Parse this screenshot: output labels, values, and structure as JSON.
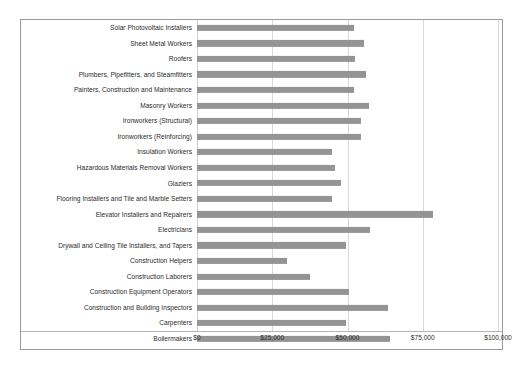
{
  "chart_data": {
    "type": "bar",
    "orientation": "horizontal",
    "title": "",
    "xlabel": "",
    "ylabel": "",
    "xlim": [
      0,
      100000
    ],
    "grid": true,
    "legend": null,
    "bar_color": "#949494",
    "tick_labels": [
      "$0",
      "$25,000",
      "$50,000",
      "$75,000",
      "$100,000"
    ],
    "ticks": [
      0,
      25000,
      50000,
      75000,
      100000
    ],
    "categories": [
      "Solar Photovoltaic Installers",
      "Sheet Metal Workers",
      "Roofers",
      "Plumbers, Pipefitters, and Steamfitters",
      "Painters, Construction and Maintenance",
      "Masonry Workers",
      "Ironworkers (Structural)",
      "Ironworkers (Reinforcing)",
      "Insulation Workers",
      "Hazardous Materials Removal Workers",
      "Glaziers",
      "Flooring Installers and Tile and Marble Setters",
      "Elevator Installers and Repairers",
      "Electricians",
      "Drywall and Ceiling Tile Installers, and Tapers",
      "Construction Helpers",
      "Construction Laborers",
      "Construction Equipment Operators",
      "Construction and Building Inspectors",
      "Carpenters",
      "Boilermakers"
    ],
    "values": [
      52000,
      55500,
      52500,
      56000,
      52000,
      57000,
      54500,
      54500,
      45000,
      46000,
      48000,
      45000,
      78500,
      57500,
      49500,
      30000,
      37500,
      50500,
      63500,
      49500,
      64000
    ]
  }
}
